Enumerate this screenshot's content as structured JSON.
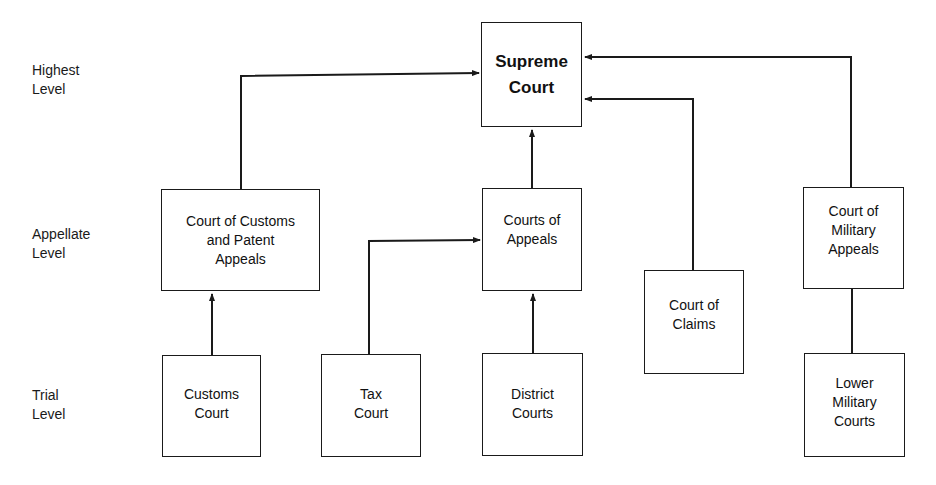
{
  "levels": {
    "highest": "Highest\nLevel",
    "appellate": "Appellate\nLevel",
    "trial": "Trial\nLevel"
  },
  "courts": {
    "supreme": "Supreme\nCourt",
    "customs_patent_appeals": "Court of Customs\nand Patent\nAppeals",
    "courts_of_appeals": "Courts of\nAppeals",
    "court_of_claims": "Court of\nClaims",
    "military_appeals": "Court of\nMilitary\nAppeals",
    "customs_court": "Customs\nCourt",
    "tax_court": "Tax\nCourt",
    "district_courts": "District\nCourts",
    "lower_military": "Lower\nMilitary\nCourts"
  },
  "edges": [
    {
      "from": "customs_court",
      "to": "customs_patent_appeals"
    },
    {
      "from": "customs_patent_appeals",
      "to": "supreme"
    },
    {
      "from": "tax_court",
      "to": "courts_of_appeals"
    },
    {
      "from": "district_courts",
      "to": "courts_of_appeals"
    },
    {
      "from": "courts_of_appeals",
      "to": "supreme"
    },
    {
      "from": "court_of_claims",
      "to": "supreme"
    },
    {
      "from": "military_appeals",
      "to": "supreme"
    },
    {
      "from": "lower_military",
      "to": "military_appeals"
    }
  ]
}
